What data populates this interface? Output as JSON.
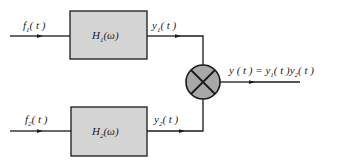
{
  "diagram": {
    "type": "block-diagram",
    "colors": {
      "block_fill": "#d4d4d4",
      "multiplier_fill": "#a8a8a8",
      "stroke": "#1a1a1a"
    },
    "inputs": [
      {
        "name": "f",
        "sub": "1",
        "arg": "( t )"
      },
      {
        "name": "f",
        "sub": "2",
        "arg": "( t )"
      }
    ],
    "blocks": [
      {
        "name": "H",
        "sub": "1",
        "arg": "(ω)"
      },
      {
        "name": "H",
        "sub": "2",
        "arg": "(ω)"
      }
    ],
    "intermediate": [
      {
        "name": "y",
        "sub": "1",
        "arg": "( t )"
      },
      {
        "name": "y",
        "sub": "2",
        "arg": "( t )"
      }
    ],
    "multiplier": {
      "symbol": "×"
    },
    "output": {
      "lhs": "y ( t ) = ",
      "t1_name": "y",
      "t1_sub": "1",
      "t1_arg": "( t )",
      "t2_name": "y",
      "t2_sub": "2",
      "t2_arg": "(  t )"
    }
  }
}
